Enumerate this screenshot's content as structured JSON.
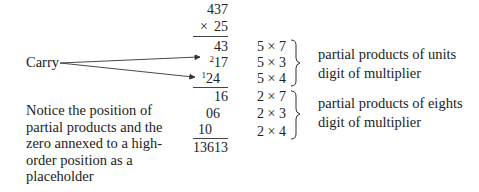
{
  "computation": {
    "multiplicand": "437",
    "multiplier_sign": "×",
    "multiplier": "25",
    "units_partials": [
      {
        "carry": "",
        "value": "43"
      },
      {
        "carry": "2",
        "value": "17"
      },
      {
        "carry": "1",
        "value": "24"
      }
    ],
    "eights_partials": [
      "16",
      "06",
      "10"
    ],
    "result": "13613"
  },
  "carry_label": "Carry",
  "units_group": {
    "expressions": [
      "5 × 7",
      "5 × 3",
      "5 × 4"
    ],
    "label_line1": "partial products of units",
    "label_line2": "digit of multiplier"
  },
  "eights_group": {
    "expressions": [
      "2 × 7",
      "2 × 3",
      "2 × 4"
    ],
    "label_line1": "partial products of eights",
    "label_line2": "digit of multiplier"
  },
  "note": {
    "lines": [
      "Notice the position of",
      "partial products and the",
      "zero annexed to a high-",
      "order position as a",
      "placeholder"
    ]
  }
}
